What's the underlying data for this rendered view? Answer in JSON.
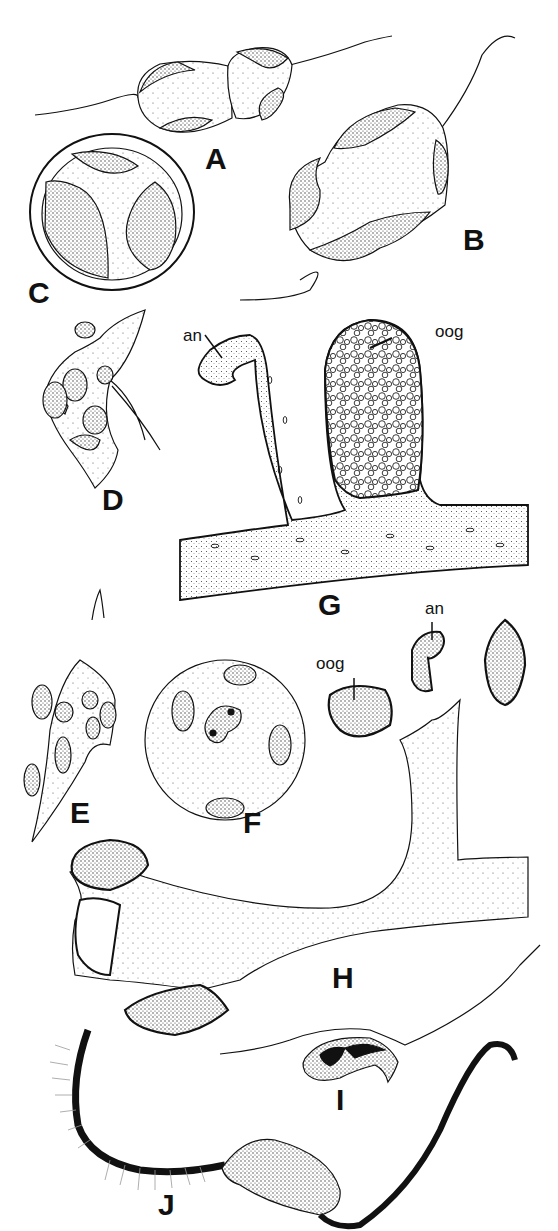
{
  "figure": {
    "panels": [
      {
        "id": "A",
        "label": "A"
      },
      {
        "id": "B",
        "label": "B"
      },
      {
        "id": "C",
        "label": "C"
      },
      {
        "id": "D",
        "label": "D"
      },
      {
        "id": "E",
        "label": "E"
      },
      {
        "id": "F",
        "label": "F"
      },
      {
        "id": "G",
        "label": "G",
        "annotations": [
          "an",
          "oog"
        ]
      },
      {
        "id": "H",
        "label": "H",
        "annotations": [
          "an",
          "oog"
        ]
      },
      {
        "id": "I",
        "label": "I"
      },
      {
        "id": "J",
        "label": "J"
      }
    ],
    "annotations": {
      "g_an": "an",
      "g_oog": "oog",
      "h_an": "an",
      "h_oog": "oog"
    },
    "colors": {
      "ink": "#111111",
      "background": "#ffffff",
      "stipple": "#bbbbbb"
    }
  }
}
